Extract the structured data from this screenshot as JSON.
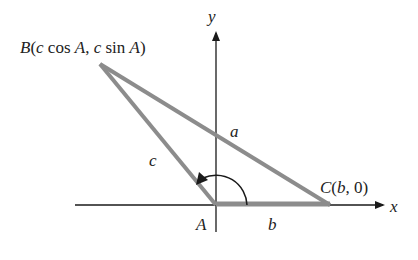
{
  "diagram": {
    "axes": {
      "x_label": "x",
      "y_label": "y"
    },
    "points": {
      "A": {
        "label": "A"
      },
      "B": {
        "letter": "B",
        "coords_open": "(",
        "c1": "c",
        "cos": " cos ",
        "A1": "A",
        "comma": ", ",
        "c2": "c",
        "sin": " sin ",
        "A2": "A",
        "coords_close": ")"
      },
      "C": {
        "letter": "C",
        "open": "(",
        "b": "b",
        "rest": ", 0)"
      }
    },
    "sides": {
      "a": "a",
      "b": "b",
      "c": "c"
    },
    "colors": {
      "triangle": "#8c8c8c",
      "axes": "#1a1a1a",
      "text": "#222222"
    }
  }
}
